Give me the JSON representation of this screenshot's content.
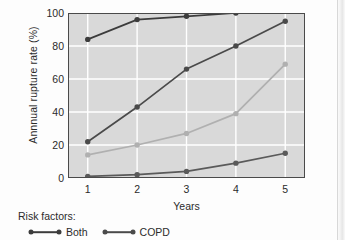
{
  "chart_data": {
    "type": "line",
    "title": "",
    "xlabel": "Years",
    "ylabel": "Annnual rupture rate (%)",
    "x": [
      1,
      2,
      3,
      4,
      5
    ],
    "categories": [
      "1",
      "2",
      "3",
      "4",
      "5"
    ],
    "xtick_labels": [
      "1",
      "2",
      "3",
      "4",
      "5"
    ],
    "ytick_labels": [
      "0",
      "20",
      "40",
      "60",
      "80",
      "100"
    ],
    "yticks": [
      0,
      20,
      40,
      60,
      80,
      100
    ],
    "xlim": [
      0.6,
      5.4
    ],
    "ylim": [
      0,
      100
    ],
    "grid": "white gridlines on gray panel",
    "legend_position": "below-left",
    "panel_color": "#d9d9d9",
    "grid_color": "#ffffff",
    "series": [
      {
        "name": "Both",
        "color": "#3c3c3c",
        "x": [
          1,
          2,
          3,
          4
        ],
        "values": [
          84,
          96,
          98,
          100
        ]
      },
      {
        "name": "Series 2",
        "color": "#4a4a4a",
        "x": [
          1,
          2,
          3,
          4,
          5
        ],
        "values": [
          22,
          43,
          66,
          80,
          95
        ]
      },
      {
        "name": "COPD",
        "color": "#b0b0b0",
        "x": [
          1,
          2,
          3,
          4,
          5
        ],
        "values": [
          14,
          20,
          27,
          39,
          69
        ]
      },
      {
        "name": "Series 4",
        "color": "#5a5a5a",
        "x": [
          1,
          2,
          3,
          4,
          5
        ],
        "values": [
          1,
          2,
          4,
          9,
          15
        ]
      }
    ]
  },
  "legend": {
    "title": "Risk factors:",
    "items": [
      {
        "label": "Both",
        "color": "#3c3c3c"
      },
      {
        "label": "COPD",
        "color": "#4a4a4a"
      }
    ]
  }
}
